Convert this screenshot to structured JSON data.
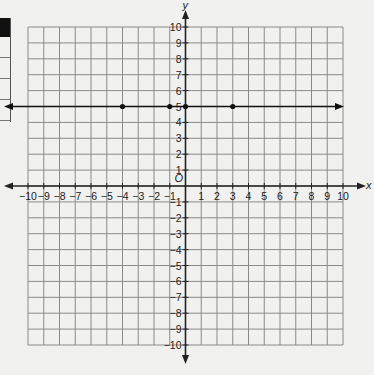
{
  "chart_data": {
    "type": "scatter",
    "title": "",
    "xlabel": "x",
    "ylabel": "y",
    "origin_label": "O",
    "xlim": [
      -10,
      10
    ],
    "ylim": [
      -10,
      10
    ],
    "grid": true,
    "x_ticks": [
      -10,
      -9,
      -8,
      -7,
      -6,
      -5,
      -4,
      -3,
      -2,
      -1,
      1,
      2,
      3,
      4,
      5,
      6,
      7,
      8,
      9,
      10
    ],
    "y_ticks": [
      -10,
      -9,
      -8,
      -7,
      -6,
      -5,
      -4,
      -3,
      -2,
      -1,
      1,
      2,
      3,
      4,
      5,
      6,
      7,
      8,
      9,
      10
    ],
    "series": [
      {
        "name": "line y=5",
        "kind": "line",
        "equation": "y = 5",
        "arrows": true,
        "points": [
          {
            "x": -4,
            "y": 5
          },
          {
            "x": -1,
            "y": 5
          },
          {
            "x": 0,
            "y": 5
          },
          {
            "x": 3,
            "y": 5
          }
        ]
      }
    ]
  },
  "colors": {
    "grid": "#8a8a8a",
    "axis": "#222222",
    "line": "#111111",
    "background": "#f1f1ef"
  }
}
